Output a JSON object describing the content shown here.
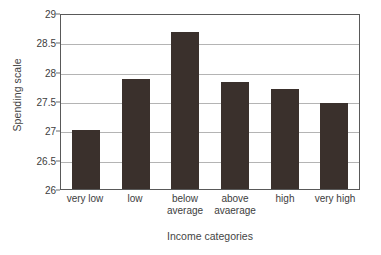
{
  "chart_data": {
    "type": "bar",
    "title": "",
    "subtitle": "",
    "xlabel": "Income categories",
    "ylabel": "Spending scale",
    "categories": [
      "very low",
      "low",
      "below average",
      "above avaerage",
      "high",
      "very high"
    ],
    "category_lines": [
      [
        "very low",
        ""
      ],
      [
        "low",
        ""
      ],
      [
        "below",
        "average"
      ],
      [
        "above",
        "avaerage"
      ],
      [
        "high",
        ""
      ],
      [
        "very high",
        ""
      ]
    ],
    "values": [
      27.0,
      27.87,
      28.68,
      27.82,
      27.71,
      27.47
    ],
    "ylim": [
      26,
      29
    ],
    "ytick_labels": [
      "26",
      "26.5",
      "27",
      "27.5",
      "28",
      "28.5",
      "29"
    ],
    "ytick_values": [
      26,
      26.5,
      27,
      27.5,
      28,
      28.5,
      29
    ],
    "grid": true,
    "grid_axis": "y",
    "legend": false,
    "legend_position": "none",
    "bar_color": "#3a302c",
    "gridline_color": "#b4b4b4",
    "axis_color": "#595959",
    "background": "#ffffff"
  }
}
